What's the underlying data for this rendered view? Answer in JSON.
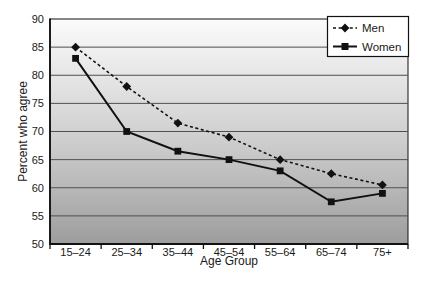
{
  "chart_data": {
    "type": "line",
    "title": "",
    "xlabel": "Age Group",
    "ylabel": "Percent who agree",
    "categories": [
      "15–24",
      "25–34",
      "35–44",
      "45–54",
      "55–64",
      "65–74",
      "75+"
    ],
    "series": [
      {
        "name": "Men",
        "marker": "diamond",
        "line_style": "dashed",
        "values": [
          85,
          78,
          71.5,
          69,
          65,
          62.5,
          60.5
        ]
      },
      {
        "name": "Women",
        "marker": "square",
        "line_style": "solid",
        "values": [
          83,
          70,
          66.5,
          65,
          63,
          57.5,
          59
        ]
      }
    ],
    "ylim": [
      50,
      90
    ],
    "ytick_step": 5,
    "ytick_labels": [
      "50",
      "55",
      "60",
      "65",
      "70",
      "75",
      "80",
      "85",
      "90"
    ],
    "grid": "horizontal",
    "legend_position": "top-right",
    "colors": {
      "series": "#111111",
      "text": "#1a1a1a",
      "gridline": "#4f4f4f",
      "axis": "#111111",
      "plot_background_top": "#fbfbfb",
      "plot_background_mid": "#cdcdcd",
      "plot_background_bottom": "#9d9d9d",
      "legend_background": "#ffffff"
    }
  }
}
